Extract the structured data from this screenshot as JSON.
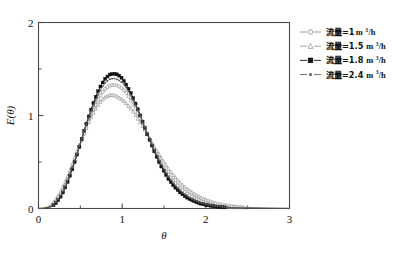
{
  "chart_data": {
    "type": "line",
    "title": "",
    "xlabel": "θ",
    "ylabel": "E(θ)",
    "xlim": [
      0,
      3
    ],
    "ylim": [
      0,
      2
    ],
    "xticks": [
      "0",
      "1",
      "2",
      "3"
    ],
    "xtick_values": [
      0,
      1,
      2,
      3
    ],
    "xminor_values": [
      0.5,
      1.5,
      2.5
    ],
    "yticks": [
      "0",
      "1",
      "2"
    ],
    "ytick_values": [
      0,
      1,
      2
    ],
    "yminor_values": [
      0.5,
      1.5
    ],
    "grid": false,
    "legend_position": "right-top",
    "x": [
      0,
      0.05,
      0.1,
      0.15,
      0.2,
      0.25,
      0.3,
      0.35,
      0.4,
      0.45,
      0.5,
      0.55,
      0.6,
      0.65,
      0.7,
      0.75,
      0.8,
      0.85,
      0.9,
      0.95,
      1.0,
      1.05,
      1.1,
      1.15,
      1.2,
      1.25,
      1.3,
      1.35,
      1.4,
      1.45,
      1.5,
      1.55,
      1.6,
      1.65,
      1.7,
      1.75,
      1.8,
      1.85,
      1.9,
      1.95,
      2.0,
      2.1,
      2.2,
      2.3,
      2.4,
      2.5,
      2.6,
      2.7,
      2.8,
      2.9,
      3.0
    ],
    "series": [
      {
        "name": "流量=1 m³/h",
        "flow_rate": 1,
        "unit": "m³/h",
        "marker": "circle-open",
        "color": "#8c8c8c",
        "peak_x": 0.92,
        "peak_y": 1.33,
        "values": [
          0,
          0.002,
          0.01,
          0.03,
          0.07,
          0.13,
          0.21,
          0.31,
          0.43,
          0.56,
          0.69,
          0.82,
          0.94,
          1.05,
          1.15,
          1.23,
          1.29,
          1.32,
          1.33,
          1.32,
          1.29,
          1.24,
          1.17,
          1.09,
          1.0,
          0.9,
          0.8,
          0.7,
          0.61,
          0.52,
          0.44,
          0.37,
          0.31,
          0.26,
          0.21,
          0.175,
          0.143,
          0.117,
          0.095,
          0.077,
          0.062,
          0.04,
          0.026,
          0.017,
          0.011,
          0.007,
          0.004,
          0.003,
          0.002,
          0.001,
          0.001
        ]
      },
      {
        "name": "流量=1.5 m³/h",
        "flow_rate": 1.5,
        "unit": "m³/h",
        "marker": "triangle-open",
        "color": "#9a9a9a",
        "peak_x": 0.88,
        "peak_y": 1.22,
        "values": [
          0,
          0.003,
          0.015,
          0.04,
          0.09,
          0.16,
          0.25,
          0.35,
          0.47,
          0.59,
          0.71,
          0.82,
          0.93,
          1.02,
          1.1,
          1.16,
          1.2,
          1.22,
          1.22,
          1.2,
          1.17,
          1.13,
          1.08,
          1.02,
          0.95,
          0.88,
          0.8,
          0.72,
          0.64,
          0.57,
          0.5,
          0.43,
          0.37,
          0.32,
          0.27,
          0.23,
          0.195,
          0.164,
          0.137,
          0.114,
          0.094,
          0.063,
          0.042,
          0.028,
          0.018,
          0.012,
          0.008,
          0.005,
          0.003,
          0.002,
          0.001
        ]
      },
      {
        "name": "流量=1.8 m³/h",
        "flow_rate": 1.8,
        "unit": "m³/h",
        "marker": "square-filled",
        "color": "#111111",
        "peak_x": 0.92,
        "peak_y": 1.45,
        "values": [
          0,
          0.001,
          0.005,
          0.018,
          0.05,
          0.105,
          0.185,
          0.29,
          0.41,
          0.55,
          0.7,
          0.85,
          0.99,
          1.12,
          1.24,
          1.33,
          1.4,
          1.44,
          1.45,
          1.44,
          1.4,
          1.33,
          1.25,
          1.15,
          1.04,
          0.92,
          0.8,
          0.69,
          0.58,
          0.48,
          0.4,
          0.32,
          0.26,
          0.21,
          0.166,
          0.132,
          0.104,
          0.082,
          0.064,
          0.05,
          0.039,
          0.023,
          0.014,
          0.008,
          0.005,
          0.003,
          0.002,
          0.001,
          0.001,
          0.0005,
          0.0003
        ]
      },
      {
        "name": "流量=2.4 m³/h",
        "flow_rate": 2.4,
        "unit": "m³/h",
        "marker": "dot-small",
        "color": "#5e5e5e",
        "peak_x": 0.9,
        "peak_y": 1.4,
        "values": [
          0,
          0.001,
          0.007,
          0.023,
          0.058,
          0.118,
          0.2,
          0.305,
          0.43,
          0.56,
          0.705,
          0.845,
          0.975,
          1.095,
          1.2,
          1.29,
          1.355,
          1.39,
          1.4,
          1.385,
          1.355,
          1.3,
          1.22,
          1.13,
          1.03,
          0.92,
          0.81,
          0.705,
          0.6,
          0.505,
          0.42,
          0.345,
          0.283,
          0.231,
          0.186,
          0.15,
          0.12,
          0.096,
          0.076,
          0.06,
          0.047,
          0.029,
          0.018,
          0.011,
          0.007,
          0.004,
          0.003,
          0.002,
          0.001,
          0.001,
          0.0005
        ]
      }
    ]
  },
  "legend": {
    "items": [
      {
        "label": "流量=1",
        "unit_base": " m",
        "unit_sup": "3",
        "unit_tail": "/h"
      },
      {
        "label": "流量=1.5",
        "unit_base": " m",
        "unit_sup": "3",
        "unit_tail": "/h"
      },
      {
        "label": "流量=1.8",
        "unit_base": " m",
        "unit_sup": "3",
        "unit_tail": "/h"
      },
      {
        "label": "流量=2.4",
        "unit_base": " m",
        "unit_sup": "3",
        "unit_tail": "/h"
      }
    ]
  },
  "axes": {
    "xlabel": "θ",
    "ylabel": "E(θ)",
    "xticklabels": [
      "0",
      "1",
      "2",
      "3"
    ],
    "yticklabels": [
      "0",
      "1",
      "2"
    ]
  }
}
